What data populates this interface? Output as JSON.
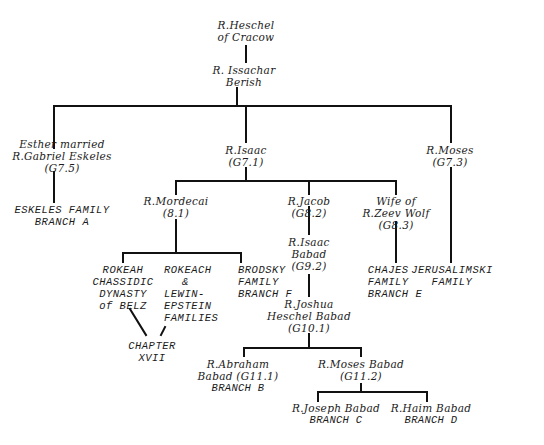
{
  "diagram": {
    "type": "family-tree",
    "nodes": {
      "heschel": {
        "lines": [
          "R.Heschel",
          "of Cracow"
        ]
      },
      "issachar": {
        "lines": [
          "R. Issachar",
          "Berish"
        ]
      },
      "esther": {
        "lines": [
          "Esther married",
          "R.Gabriel Eskeles",
          "(G7.5)"
        ]
      },
      "isaac": {
        "lines": [
          "R.Isaac",
          "(G7.1)"
        ]
      },
      "moses": {
        "lines": [
          "R.Moses",
          "(G7.3)"
        ]
      },
      "eskeles": {
        "lines": [
          "ESKELES FAMILY",
          "BRANCH A"
        ]
      },
      "mordecai": {
        "lines": [
          "R.Mordecai",
          "(8.1)"
        ]
      },
      "jacob": {
        "lines": [
          "R.Jacob",
          "(G8.2)"
        ]
      },
      "zeev": {
        "lines": [
          "Wife of",
          "R.Zeev Wolf",
          "(G8.3)"
        ]
      },
      "isaac_babad": {
        "lines": [
          "R.Isaac",
          "Babad",
          "(G9.2)"
        ]
      },
      "chajes": {
        "lines": [
          "CHAJES",
          "FAMILY",
          "BRANCH E"
        ]
      },
      "jerusalimski": {
        "lines": [
          "JERUSALIMSKI",
          "FAMILY"
        ]
      },
      "rokeah": {
        "lines": [
          "ROKEAH",
          "CHASSIDIC",
          "DYNASTY",
          "of BELZ"
        ]
      },
      "rokeach_lewin": {
        "lines": [
          "ROKEACH",
          "&",
          "LEWIN-",
          "EPSTEIN",
          "FAMILIES"
        ]
      },
      "brodsky": {
        "lines": [
          "BRODSKY",
          "FAMILY",
          "BRANCH F"
        ]
      },
      "joshua": {
        "lines": [
          "R.Joshua",
          "Heschel Babad",
          "(G10.1)"
        ]
      },
      "chapter": {
        "lines": [
          "CHAPTER",
          "XVII"
        ]
      },
      "abraham": {
        "lines": [
          "R.Abraham",
          "Babad  (G11.1)",
          "BRANCH B"
        ]
      },
      "moses_babad": {
        "lines": [
          "R.Moses Babad",
          "(G11.2)"
        ]
      },
      "joseph": {
        "lines": [
          "R.Joseph  Babad",
          "BRANCH C"
        ]
      },
      "haim": {
        "lines": [
          "R.Haim Babad",
          "BRANCH D"
        ]
      }
    },
    "line_color": "#111111",
    "text_color": "#1a1a1a"
  }
}
